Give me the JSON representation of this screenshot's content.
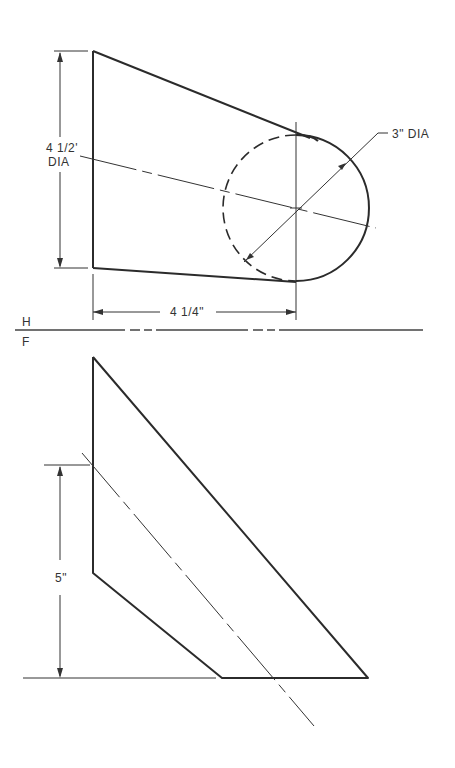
{
  "drawing": {
    "views": [
      "top view (H)",
      "front view (F)"
    ],
    "reference_line": {
      "above_label": "H",
      "below_label": "F"
    },
    "dimensions": {
      "top_height_value": "4 1/2'",
      "top_height_suffix": "DIA",
      "circle_diameter": "3\" DIA",
      "top_width": "4 1/4\"",
      "front_height": "5\""
    }
  }
}
